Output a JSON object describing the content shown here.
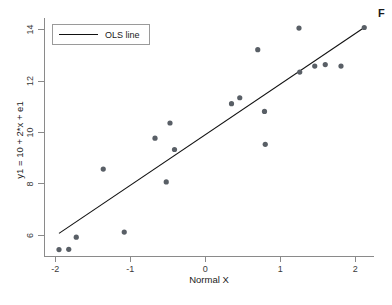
{
  "caption_fragment": "F",
  "legend": {
    "entries": [
      {
        "label": "OLS line",
        "marker": "line",
        "color": "#111111"
      }
    ]
  },
  "chart_data": {
    "type": "scatter",
    "title": "",
    "subtitle": "",
    "xlabel": "Normal X",
    "ylabel": "y1 = 10 + 2*x + e1",
    "xlim": [
      -2.15,
      2.25
    ],
    "ylim": [
      5.2,
      14.45
    ],
    "xticks": [
      -2,
      -1,
      0,
      1,
      2
    ],
    "xticklabels": [
      "-2",
      "-1",
      "0",
      "1",
      "2"
    ],
    "yticks": [
      6,
      8,
      10,
      12,
      14
    ],
    "yticklabels": [
      "6",
      "8",
      "10",
      "12",
      "14"
    ],
    "grid": false,
    "legend_position": "upper left",
    "marker_color": "#595f66",
    "line_color": "#111111",
    "series": [
      {
        "name": "observations",
        "type": "scatter",
        "points": [
          {
            "x": -1.95,
            "y": 5.45
          },
          {
            "x": -1.82,
            "y": 5.46
          },
          {
            "x": -1.72,
            "y": 5.93
          },
          {
            "x": -1.36,
            "y": 8.58
          },
          {
            "x": -1.08,
            "y": 6.13
          },
          {
            "x": -0.67,
            "y": 9.78
          },
          {
            "x": -0.52,
            "y": 8.08
          },
          {
            "x": -0.47,
            "y": 10.37
          },
          {
            "x": -0.41,
            "y": 9.34
          },
          {
            "x": 0.35,
            "y": 11.12
          },
          {
            "x": 0.46,
            "y": 11.35
          },
          {
            "x": 0.7,
            "y": 13.22
          },
          {
            "x": 0.79,
            "y": 10.82
          },
          {
            "x": 0.8,
            "y": 9.54
          },
          {
            "x": 1.25,
            "y": 14.06
          },
          {
            "x": 1.26,
            "y": 12.35
          },
          {
            "x": 1.46,
            "y": 12.58
          },
          {
            "x": 1.6,
            "y": 12.64
          },
          {
            "x": 1.81,
            "y": 12.58
          },
          {
            "x": 2.12,
            "y": 14.08
          }
        ]
      },
      {
        "name": "OLS line",
        "type": "line",
        "points": [
          {
            "x": -1.95,
            "y": 6.08
          },
          {
            "x": 2.12,
            "y": 14.08
          }
        ]
      }
    ]
  }
}
